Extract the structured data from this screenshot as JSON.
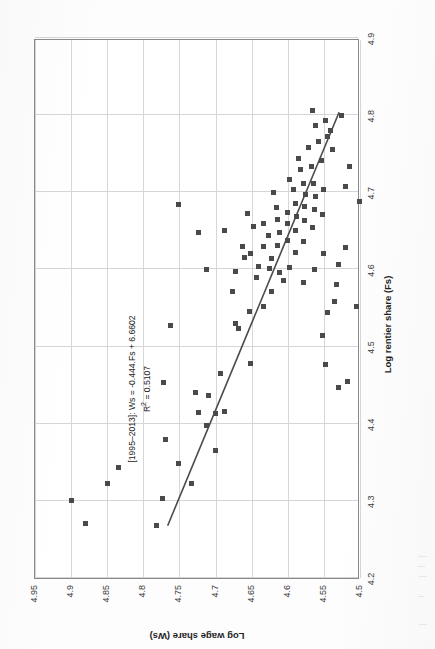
{
  "chart_data": {
    "type": "scatter",
    "title": "",
    "xlabel": "Log rentier share (Fs)",
    "ylabel": "Log wage share (Ws)",
    "xlim": [
      4.2,
      4.9
    ],
    "ylim": [
      4.5,
      4.95
    ],
    "xticks": [
      "4.2",
      "4.3",
      "4.4",
      "4.5",
      "4.6",
      "4.7",
      "4.8",
      "4.9"
    ],
    "yticks": [
      "4.5",
      "4.55",
      "4.6",
      "4.65",
      "4.7",
      "4.75",
      "4.8",
      "4.85",
      "4.9",
      "4.95"
    ],
    "grid": true,
    "legend": "none",
    "annotations": [
      "[1995–2013]: Ws = -0.444.Fs + 6.6602",
      "R² = 0.5107"
    ],
    "fit": {
      "equation": "Ws = -0.444.Fs + 6.6602",
      "slope": -0.444,
      "intercept": 6.6602,
      "r_squared": 0.5107,
      "period": "1995–2013",
      "x_start": 4.268,
      "x_end": 4.806,
      "color": "#4a4a4a"
    },
    "marker": {
      "shape": "square",
      "color": "#4a4a4a",
      "size": 5
    },
    "points": [
      [
        4.3,
        4.9
      ],
      [
        4.271,
        4.88
      ],
      [
        4.323,
        4.85
      ],
      [
        4.343,
        4.835
      ],
      [
        4.268,
        4.782
      ],
      [
        4.303,
        4.773
      ],
      [
        4.38,
        4.77
      ],
      [
        4.349,
        4.752
      ],
      [
        4.453,
        4.772
      ],
      [
        4.323,
        4.733
      ],
      [
        4.414,
        4.723
      ],
      [
        4.441,
        4.728
      ],
      [
        4.527,
        4.763
      ],
      [
        4.398,
        4.713
      ],
      [
        4.436,
        4.71
      ],
      [
        4.413,
        4.7
      ],
      [
        4.365,
        4.7
      ],
      [
        4.684,
        4.752
      ],
      [
        4.416,
        4.688
      ],
      [
        4.465,
        4.693
      ],
      [
        4.648,
        4.723
      ],
      [
        4.6,
        4.713
      ],
      [
        4.53,
        4.672
      ],
      [
        4.524,
        4.668
      ],
      [
        4.572,
        4.676
      ],
      [
        4.597,
        4.672
      ],
      [
        4.651,
        4.688
      ],
      [
        4.478,
        4.652
      ],
      [
        4.545,
        4.653
      ],
      [
        4.615,
        4.66
      ],
      [
        4.63,
        4.663
      ],
      [
        4.621,
        4.651
      ],
      [
        4.589,
        4.643
      ],
      [
        4.604,
        4.641
      ],
      [
        4.552,
        4.633
      ],
      [
        4.655,
        4.647
      ],
      [
        4.63,
        4.634
      ],
      [
        4.673,
        4.656
      ],
      [
        4.571,
        4.623
      ],
      [
        4.601,
        4.626
      ],
      [
        4.614,
        4.623
      ],
      [
        4.644,
        4.627
      ],
      [
        4.66,
        4.633
      ],
      [
        4.596,
        4.612
      ],
      [
        4.631,
        4.614
      ],
      [
        4.586,
        4.606
      ],
      [
        4.648,
        4.611
      ],
      [
        4.665,
        4.614
      ],
      [
        4.68,
        4.616
      ],
      [
        4.7,
        4.62
      ],
      [
        4.603,
        4.597
      ],
      [
        4.637,
        4.6
      ],
      [
        4.659,
        4.6
      ],
      [
        4.674,
        4.601
      ],
      [
        4.622,
        4.589
      ],
      [
        4.651,
        4.59
      ],
      [
        4.668,
        4.588
      ],
      [
        4.686,
        4.59
      ],
      [
        4.703,
        4.592
      ],
      [
        4.717,
        4.598
      ],
      [
        4.583,
        4.578
      ],
      [
        4.636,
        4.578
      ],
      [
        4.664,
        4.577
      ],
      [
        4.681,
        4.577
      ],
      [
        4.697,
        4.575
      ],
      [
        4.711,
        4.578
      ],
      [
        4.73,
        4.582
      ],
      [
        4.744,
        4.585
      ],
      [
        4.6,
        4.563
      ],
      [
        4.654,
        4.566
      ],
      [
        4.678,
        4.563
      ],
      [
        4.694,
        4.562
      ],
      [
        4.712,
        4.564
      ],
      [
        4.733,
        4.567
      ],
      [
        4.758,
        4.571
      ],
      [
        4.62,
        4.551
      ],
      [
        4.671,
        4.552
      ],
      [
        4.704,
        4.55
      ],
      [
        4.741,
        4.553
      ],
      [
        4.766,
        4.557
      ],
      [
        4.786,
        4.562
      ],
      [
        4.806,
        4.566
      ],
      [
        4.772,
        4.545
      ],
      [
        4.793,
        4.548
      ],
      [
        4.544,
        4.545
      ],
      [
        4.514,
        4.552
      ],
      [
        4.558,
        4.535
      ],
      [
        4.58,
        4.532
      ],
      [
        4.607,
        4.53
      ],
      [
        4.477,
        4.548
      ],
      [
        4.447,
        4.53
      ],
      [
        4.455,
        4.517
      ],
      [
        4.756,
        4.538
      ],
      [
        4.78,
        4.541
      ],
      [
        4.707,
        4.52
      ],
      [
        4.733,
        4.515
      ],
      [
        4.8,
        4.525
      ],
      [
        4.552,
        4.505
      ],
      [
        4.688,
        4.501
      ],
      [
        4.628,
        4.52
      ]
    ]
  },
  "axes": {
    "x_title": "Log rentier share (Fs)",
    "y_title": "Log wage share (Ws)"
  }
}
